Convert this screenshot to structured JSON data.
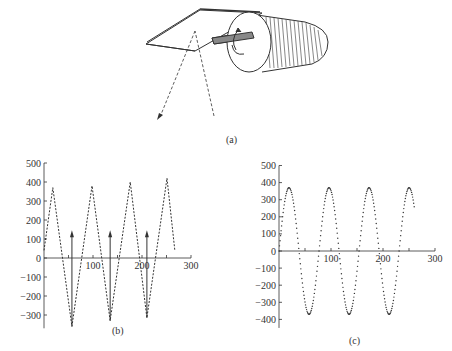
{
  "figure": {
    "panels": [
      {
        "id": "a",
        "label": "(a)",
        "description": "Galvanometer mirror driven by a motor: mirror plate mounted on a shaft with rotation arrows; dashed incident and reflected light beams"
      },
      {
        "id": "b",
        "label": "(b)"
      },
      {
        "id": "c",
        "label": "(c)"
      }
    ]
  },
  "colors": {
    "ink": "#333333",
    "background": "#ffffff"
  },
  "chart_data": [
    {
      "panel": "b",
      "type": "line",
      "style": "dashed triangle wave with upward arrows",
      "title": "",
      "xlabel": "",
      "ylabel": "",
      "xlim": [
        0,
        300
      ],
      "ylim": [
        -370,
        500
      ],
      "x_ticks": [
        "100",
        "200",
        "300"
      ],
      "y_ticks": [
        "500",
        "400",
        "300",
        "200",
        "100",
        "0",
        "-100",
        "-200",
        "-300"
      ],
      "grid": false,
      "series": [
        {
          "name": "triangle",
          "x": [
            0,
            18,
            57,
            98,
            135,
            176,
            210,
            251,
            267
          ],
          "y": [
            40,
            370,
            -360,
            380,
            -330,
            400,
            -315,
            420,
            40
          ]
        }
      ],
      "annotations": [
        {
          "type": "arrow",
          "x": 57,
          "from": -360,
          "to": 135
        },
        {
          "type": "arrow",
          "x": 135,
          "from": -330,
          "to": 135
        },
        {
          "type": "arrow",
          "x": 210,
          "from": -315,
          "to": 135
        }
      ]
    },
    {
      "panel": "c",
      "type": "line",
      "style": "dotted sinusoid",
      "title": "",
      "xlabel": "",
      "ylabel": "",
      "xlim": [
        0,
        300
      ],
      "ylim": [
        -450,
        500
      ],
      "x_ticks": [
        "100",
        "200",
        "300"
      ],
      "y_ticks": [
        "500",
        "400",
        "300",
        "200",
        "100",
        "0",
        "-100",
        "-200",
        "-300",
        "-400"
      ],
      "grid": false,
      "series": [
        {
          "name": "sine",
          "amplitude": 370,
          "period": 77,
          "x_start": 0,
          "x_end": 260,
          "peaks_x": [
            22,
            99,
            176,
            253
          ],
          "troughs_x": [
            60,
            137,
            214
          ],
          "end_value": 300
        }
      ]
    }
  ]
}
